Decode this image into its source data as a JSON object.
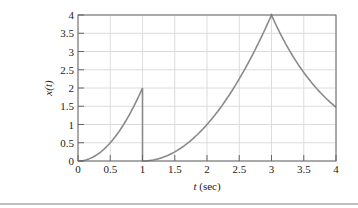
{
  "chart_data": {
    "type": "line",
    "title": "",
    "xlabel": "t (sec)",
    "xlabel_var": "t",
    "xlabel_unit": " (sec)",
    "ylabel": "x(t)",
    "xlim": [
      0,
      4
    ],
    "ylim": [
      0,
      4
    ],
    "grid": true,
    "legend": null,
    "xticks": [
      0,
      0.5,
      1,
      1.5,
      2,
      2.5,
      3,
      3.5,
      4
    ],
    "xtick_labels": [
      "0",
      "0.5",
      "1",
      "1.5",
      "2",
      "2.5",
      "3",
      "3.5",
      "4"
    ],
    "yticks": [
      0,
      0.5,
      1,
      1.5,
      2,
      2.5,
      3,
      3.5,
      4
    ],
    "ytick_labels": [
      "0",
      "0.5",
      "1",
      "1.5",
      "2",
      "2.5",
      "3",
      "3.5",
      "4"
    ],
    "series": [
      {
        "name": "x(t)",
        "segments": [
          {
            "t_range": [
              0,
              1
            ],
            "shape": "2t^2",
            "points": [
              [
                0,
                0
              ],
              [
                0.25,
                0.125
              ],
              [
                0.5,
                0.5
              ],
              [
                0.75,
                1.125
              ],
              [
                1,
                2
              ]
            ]
          },
          {
            "t_range": [
              1,
              1
            ],
            "shape": "vertical drop",
            "points": [
              [
                1,
                2
              ],
              [
                1,
                0
              ]
            ]
          },
          {
            "t_range": [
              1,
              3
            ],
            "shape": "(t-1)^2",
            "points": [
              [
                1,
                0
              ],
              [
                1.5,
                0.25
              ],
              [
                2,
                1
              ],
              [
                2.5,
                2.25
              ],
              [
                3,
                4
              ]
            ]
          },
          {
            "t_range": [
              3,
              4
            ],
            "shape": "4e^-(t-3)",
            "points": [
              [
                3,
                4
              ],
              [
                3.25,
                3.12
              ],
              [
                3.5,
                2.43
              ],
              [
                3.75,
                1.89
              ],
              [
                4,
                1.47
              ]
            ]
          }
        ]
      }
    ]
  },
  "colors": {
    "curve": "#8a8a8a",
    "grid": "#dcdcdc",
    "axes": "#666666",
    "divider": "#aaaaaa"
  }
}
